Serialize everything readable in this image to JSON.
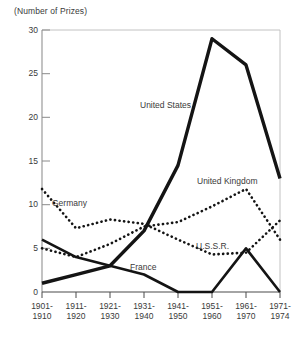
{
  "chart_data": {
    "type": "line",
    "title": "(Number of Prizes)",
    "xlabel": "",
    "ylabel": "(Number of Prizes)",
    "ylim": [
      0,
      30
    ],
    "yticks": [
      0,
      5,
      10,
      15,
      20,
      25,
      30
    ],
    "ytick_labels": [
      "0",
      "5",
      "10",
      "15",
      "20",
      "25",
      "30"
    ],
    "grid": false,
    "legend_position": "inline-annotations",
    "categories": [
      "1901-\n1910",
      "1911-\n1920",
      "1921-\n1930",
      "1931-\n1940",
      "1941-\n1950",
      "1951-\n1960",
      "1961-\n1970",
      "1971-\n1974"
    ],
    "categories_line1": [
      "1901-",
      "1911-",
      "1921-",
      "1931-",
      "1941-",
      "1951-",
      "1961-",
      "1971-"
    ],
    "categories_line2": [
      "1910",
      "1920",
      "1930",
      "1940",
      "1950",
      "1960",
      "1970",
      "1974"
    ],
    "series": [
      {
        "name": "United States",
        "style": "solid-thick",
        "values": [
          1,
          2,
          3,
          7,
          14.5,
          29,
          26,
          13
        ]
      },
      {
        "name": "United Kingdom",
        "style": "dotted",
        "values": [
          5,
          4,
          5.5,
          7.5,
          8,
          9.8,
          11.8,
          6
        ]
      },
      {
        "name": "Germany",
        "style": "dotted",
        "values": [
          11.8,
          7.3,
          8.3,
          7.8,
          6,
          4.3,
          4.5,
          8.2
        ]
      },
      {
        "name": "France",
        "style": "solid",
        "values": [
          6,
          4,
          3,
          2,
          0,
          0,
          5,
          0
        ]
      },
      {
        "name": "U.S.S.R.",
        "style": "dashed",
        "values": [
          2,
          0,
          0,
          0,
          0,
          3.3,
          4,
          0.8
        ]
      }
    ],
    "annotations": [
      {
        "text": "United States",
        "x_px": 140,
        "y_px": 106
      },
      {
        "text": "United Kingdom",
        "x_px": 203,
        "y_px": 182
      },
      {
        "text": "Germany",
        "x_px": 52,
        "y_px": 204
      },
      {
        "text": "U.S.S.R.",
        "x_px": 196,
        "y_px": 247
      },
      {
        "text": "France",
        "x_px": 132,
        "y_px": 268
      }
    ]
  },
  "colors": {
    "ink": "#1a1a1a",
    "text": "#3a3a3a",
    "frame": "#b8b8b8",
    "background": "#ffffff"
  }
}
